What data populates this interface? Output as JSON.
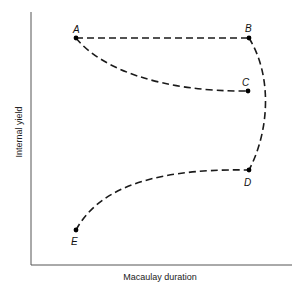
{
  "diagram": {
    "x_axis_label": "Macaulay duration",
    "y_axis_label": "Internal yield",
    "points": [
      {
        "id": "A",
        "label": "A"
      },
      {
        "id": "B",
        "label": "B"
      },
      {
        "id": "C",
        "label": "C"
      },
      {
        "id": "D",
        "label": "D"
      },
      {
        "id": "E",
        "label": "E"
      }
    ],
    "curves": [
      {
        "from": "A",
        "to": "B",
        "style": "dashed",
        "shape": "straight"
      },
      {
        "from": "A",
        "to": "C",
        "style": "dashed",
        "shape": "concave curve"
      },
      {
        "from": "B",
        "to": "D",
        "style": "dashed",
        "shape": "outward bulge"
      },
      {
        "from": "E",
        "to": "D",
        "style": "dashed",
        "shape": "concave rising curve"
      }
    ],
    "colors": {
      "line": "#1a1a1a",
      "axis": "#555555",
      "background": "#ffffff"
    }
  }
}
